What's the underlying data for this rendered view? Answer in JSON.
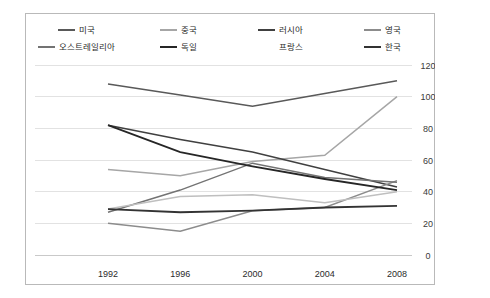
{
  "chart_data": {
    "type": "line",
    "title": "",
    "subtitle": "",
    "xlabel": "",
    "ylabel": "",
    "x": [
      "1992",
      "1996",
      "2000",
      "2004",
      "2008"
    ],
    "categories": [
      "1992",
      "1996",
      "2000",
      "2004",
      "2008"
    ],
    "xtick_labels": [
      "1992",
      "1996",
      "2000",
      "2004",
      "2008"
    ],
    "ytick_labels": [
      "0",
      "20",
      "40",
      "60",
      "80",
      "100",
      "120"
    ],
    "ytick_values": [
      0,
      20,
      40,
      60,
      80,
      100,
      120
    ],
    "ylim": [
      0,
      120
    ],
    "y_axis_position": "right",
    "grid": true,
    "grid_axis": "y",
    "legend_position": "top",
    "legend_columns": 4,
    "series": [
      {
        "name": "미국",
        "color": "#595959",
        "width": 1.5,
        "values": [
          108,
          101,
          94,
          102,
          110
        ]
      },
      {
        "name": "중국",
        "color": "#a6a6a6",
        "width": 1.5,
        "values": [
          54,
          50,
          59,
          63,
          100
        ]
      },
      {
        "name": "러시아",
        "color": "#404040",
        "width": 1.5,
        "values": [
          82,
          73,
          65,
          54,
          43
        ]
      },
      {
        "name": "영국",
        "color": "#8c8c8c",
        "width": 1.5,
        "values": [
          20,
          15,
          28,
          30,
          47
        ]
      },
      {
        "name": "오스트레일리아",
        "color": "#737373",
        "width": 1.5,
        "values": [
          27,
          41,
          58,
          49,
          46
        ]
      },
      {
        "name": "독일",
        "color": "#262626",
        "width": 1.8,
        "values": [
          82,
          65,
          56,
          48,
          41
        ]
      },
      {
        "name": "프랑스",
        "color": "#bfbfbf",
        "width": 1.5,
        "values": [
          29,
          37,
          38,
          33,
          40
        ]
      },
      {
        "name": "한국",
        "color": "#333333",
        "width": 1.8,
        "values": [
          29,
          27,
          28,
          30,
          31
        ]
      }
    ]
  }
}
